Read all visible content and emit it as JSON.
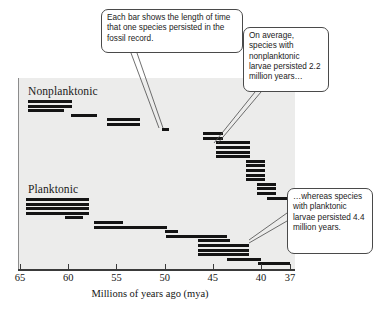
{
  "chart_data": {
    "type": "bar",
    "title": "",
    "subtitle": "",
    "xlabel": "Millions of years ago (mya)",
    "ylabel": "",
    "xlim": [
      65,
      37
    ],
    "x_axis_inverted": true,
    "grid": false,
    "legend_position": "none",
    "xticks": [
      65,
      60,
      55,
      50,
      45,
      40,
      37
    ],
    "xtick_labels": [
      "65",
      "60",
      "55",
      "50",
      "45",
      "40",
      "37"
    ],
    "groups": [
      {
        "name": "Nonplanktonic",
        "label": "Nonplanktonic",
        "mean_duration_myr": 2.2,
        "bars": [
          {
            "start": 64.2,
            "end": 59.6
          },
          {
            "start": 64.2,
            "end": 59.6
          },
          {
            "start": 64.2,
            "end": 60.4
          },
          {
            "start": 59.7,
            "end": 57.0
          },
          {
            "start": 56.0,
            "end": 52.6
          },
          {
            "start": 56.0,
            "end": 52.6
          },
          {
            "start": 50.3,
            "end": 49.6
          },
          {
            "start": 46.0,
            "end": 43.9
          },
          {
            "start": 46.0,
            "end": 43.9
          },
          {
            "start": 44.7,
            "end": 41.2
          },
          {
            "start": 44.7,
            "end": 41.2
          },
          {
            "start": 44.7,
            "end": 41.2
          },
          {
            "start": 44.7,
            "end": 41.2
          },
          {
            "start": 41.6,
            "end": 39.6
          },
          {
            "start": 41.6,
            "end": 39.6
          },
          {
            "start": 41.6,
            "end": 39.6
          },
          {
            "start": 41.6,
            "end": 39.6
          },
          {
            "start": 41.6,
            "end": 39.6
          },
          {
            "start": 40.4,
            "end": 38.4
          },
          {
            "start": 40.4,
            "end": 38.4
          },
          {
            "start": 40.4,
            "end": 38.4
          },
          {
            "start": 39.4,
            "end": 37.2
          }
        ]
      },
      {
        "name": "Planktonic",
        "label": "Planktonic",
        "mean_duration_myr": 4.4,
        "bars": [
          {
            "start": 64.4,
            "end": 57.8
          },
          {
            "start": 64.4,
            "end": 57.8
          },
          {
            "start": 64.4,
            "end": 57.8
          },
          {
            "start": 64.4,
            "end": 57.8
          },
          {
            "start": 60.3,
            "end": 58.5
          },
          {
            "start": 57.3,
            "end": 54.3
          },
          {
            "start": 57.3,
            "end": 49.8
          },
          {
            "start": 50.0,
            "end": 48.6
          },
          {
            "start": 49.9,
            "end": 43.5
          },
          {
            "start": 46.5,
            "end": 43.2
          },
          {
            "start": 46.5,
            "end": 41.3
          },
          {
            "start": 46.5,
            "end": 41.3
          },
          {
            "start": 46.5,
            "end": 41.3
          },
          {
            "start": 43.5,
            "end": 40.0
          },
          {
            "start": 40.3,
            "end": 37.0
          }
        ]
      }
    ],
    "annotations": [
      {
        "id": "bar-meaning",
        "text": "Each bar shows the length of time that one species persisted in the fossil record."
      },
      {
        "id": "nonplanktonic-avg",
        "text": "On average, species with nonplanktonic larvae persisted 2.2 million years…"
      },
      {
        "id": "planktonic-avg",
        "text": "…whereas species with planktonic larvae persisted 4.4 million years."
      }
    ],
    "colors": {
      "bar": "#141414",
      "plot_background": "#ececeb",
      "axis": "#3a3a3a",
      "callout_border": "#4a4a4a",
      "callout_background": "#ffffff"
    }
  },
  "axis": {
    "title": "Millions of years ago (mya)",
    "ticks": [
      "65",
      "60",
      "55",
      "50",
      "45",
      "40",
      "37"
    ]
  },
  "groups": {
    "nonplanktonic_label": "Nonplanktonic",
    "planktonic_label": "Planktonic"
  },
  "callouts": {
    "bar_meaning": "Each bar shows the length of time that one species persisted in the fossil record.",
    "nonplanktonic_avg": "On average, species with nonplanktonic larvae persisted 2.2 million years…",
    "planktonic_avg": "…whereas species with planktonic larvae persisted 4.4 million years."
  }
}
